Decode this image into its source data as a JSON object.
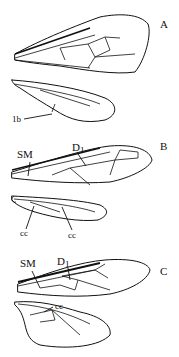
{
  "figure": {
    "panels": [
      {
        "id": "A",
        "label": "A",
        "annotations": [
          "1b"
        ]
      },
      {
        "id": "B",
        "label": "B",
        "annotations": [
          "SM",
          "D1",
          "cc",
          "cc"
        ]
      },
      {
        "id": "C",
        "label": "C",
        "annotations": [
          "SM",
          "D1",
          "cc"
        ]
      }
    ],
    "A": {
      "label": "A",
      "lb": "1b"
    },
    "B": {
      "label": "B",
      "sm": "SM",
      "d": "D",
      "d_sub": "1",
      "cc1": "cc",
      "cc2": "cc"
    },
    "C": {
      "label": "C",
      "sm": "SM",
      "d": "D",
      "d_sub": "1",
      "cc": "cc"
    }
  }
}
